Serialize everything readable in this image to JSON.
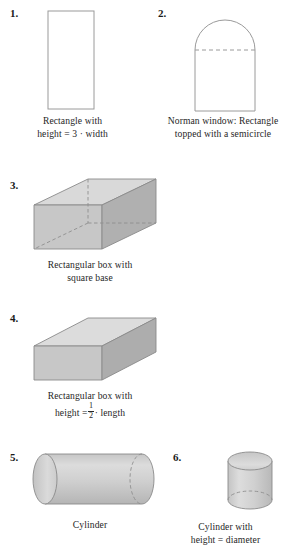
{
  "page": {
    "background_color": "#ffffff",
    "text_color": "#262626"
  },
  "palette": {
    "stroke": "#8a8a8a",
    "stroke_dark": "#7a7a7a",
    "dashed": "#8f8f8f",
    "face_top": "#d9d9d9",
    "face_front": "#c9c9c9",
    "face_side": "#b3b3b3",
    "cylinder_body": "#cccccc",
    "cylinder_cap": "#d2d2d2",
    "white_fill": "#ffffff"
  },
  "items": [
    {
      "number": "1.",
      "shape": "rectangle",
      "caption_lines": [
        "Rectangle with",
        "height = 3 · width"
      ]
    },
    {
      "number": "2.",
      "shape": "norman-window",
      "caption_lines": [
        "Norman window: Rectangle",
        "topped with a semicircle"
      ]
    },
    {
      "number": "3.",
      "shape": "rectangular-box-square-base",
      "caption_lines": [
        "Rectangular box with",
        "square base"
      ]
    },
    {
      "number": "4.",
      "shape": "rectangular-box-half-height",
      "caption_lines": [
        "Rectangular box with",
        "height ="
      ],
      "caption_fraction": {
        "numerator": "1",
        "denominator": "2"
      },
      "caption_tail": "· length"
    },
    {
      "number": "5.",
      "shape": "cylinder-horizontal",
      "caption_lines": [
        "Cylinder"
      ]
    },
    {
      "number": "6.",
      "shape": "cylinder-vertical",
      "caption_lines": [
        "Cylinder with",
        "height = diameter"
      ]
    }
  ]
}
